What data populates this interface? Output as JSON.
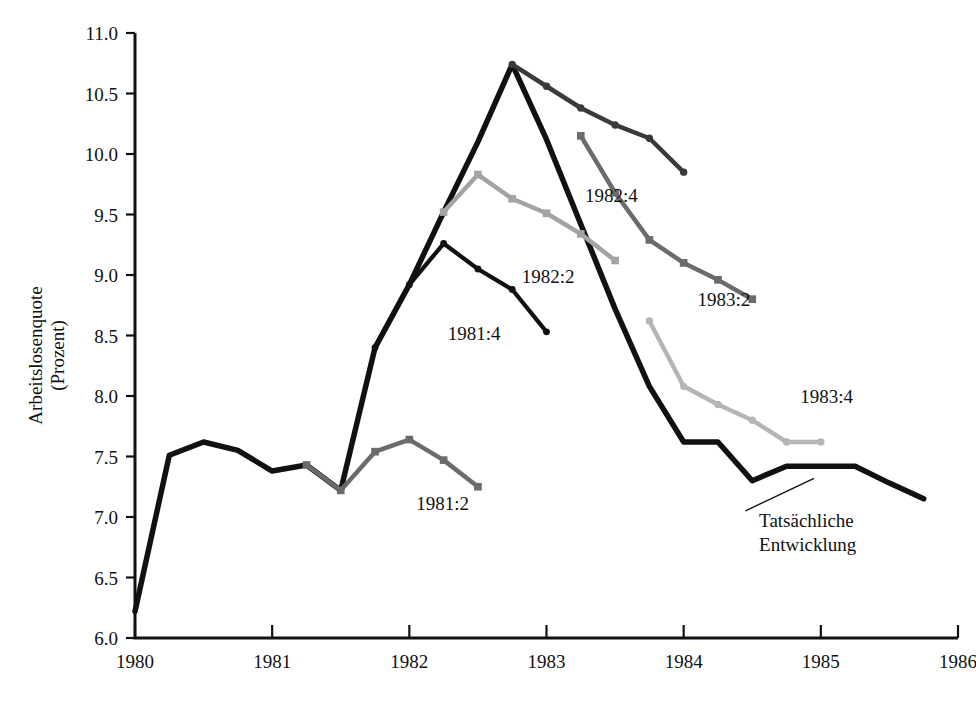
{
  "chart_data": {
    "type": "line",
    "title": "",
    "xlabel": "",
    "ylabel": "Arbeitslosenquote\n(Prozent)",
    "ylabel_line1": "Arbeitslosenquote",
    "ylabel_line2": "(Prozent)",
    "xlim": [
      1980,
      1986
    ],
    "ylim": [
      6.0,
      11.0
    ],
    "grid": false,
    "legend_position": "inline-annotations",
    "ytick_labels": [
      "11.0",
      "10.5",
      "10.0",
      "9.5",
      "9.0",
      "8.5",
      "8.0",
      "7.5",
      "7.0",
      "6.5",
      "6.0"
    ],
    "ytick_values": [
      11.0,
      10.5,
      10.0,
      9.5,
      9.0,
      8.5,
      8.0,
      7.5,
      7.0,
      6.5,
      6.0
    ],
    "xtick_labels": [
      "1980",
      "1981",
      "1982",
      "1983",
      "1984",
      "1985",
      "1986"
    ],
    "xtick_values": [
      1980,
      1981,
      1982,
      1983,
      1984,
      1985,
      1986
    ],
    "series": [
      {
        "name": "Tatsächliche Entwicklung",
        "label": "Tatsächliche\nEntwicklung",
        "label_line1": "Tatsächliche",
        "label_line2": "Entwicklung",
        "color": "#111111",
        "marker": "none",
        "width": 5.5,
        "label_x": 1984.55,
        "label_y": 6.92,
        "leader": [
          [
            1984.45,
            7.05
          ],
          [
            1984.95,
            7.32
          ]
        ],
        "x": [
          1980.0,
          1980.25,
          1980.5,
          1980.75,
          1981.0,
          1981.25,
          1981.5,
          1981.75,
          1982.0,
          1982.25,
          1982.5,
          1982.75,
          1983.0,
          1983.25,
          1983.5,
          1983.75,
          1984.0,
          1984.25,
          1984.5,
          1984.75,
          1985.0,
          1985.25,
          1985.5,
          1985.75
        ],
        "y": [
          6.22,
          7.51,
          7.62,
          7.55,
          7.38,
          7.43,
          7.22,
          8.4,
          8.92,
          9.52,
          10.1,
          10.74,
          10.12,
          9.42,
          8.72,
          8.08,
          7.62,
          7.62,
          7.3,
          7.42,
          7.42,
          7.42,
          7.28,
          7.15
        ]
      },
      {
        "name": "1981:2",
        "label": "1981:2",
        "color": "#6b6b6b",
        "marker": "square",
        "width": 4.5,
        "label_x": 1982.05,
        "label_y": 7.06,
        "x": [
          1981.25,
          1981.5,
          1981.75,
          1982.0,
          1982.25,
          1982.5
        ],
        "y": [
          7.43,
          7.22,
          7.54,
          7.64,
          7.47,
          7.25
        ]
      },
      {
        "name": "1981:4",
        "label": "1981:4",
        "color": "#111111",
        "marker": "circle",
        "width": 4.2,
        "label_x": 1982.28,
        "label_y": 8.46,
        "x": [
          1981.75,
          1982.0,
          1982.25,
          1982.5,
          1982.75,
          1983.0
        ],
        "y": [
          8.4,
          8.92,
          9.26,
          9.05,
          8.88,
          8.53
        ]
      },
      {
        "name": "1982:2",
        "label": "1982:2",
        "color": "#a3a3a3",
        "marker": "square",
        "width": 4.5,
        "label_x": 1982.82,
        "label_y": 8.93,
        "x": [
          1982.25,
          1982.5,
          1982.75,
          1983.0,
          1983.25,
          1983.5
        ],
        "y": [
          9.52,
          9.83,
          9.63,
          9.51,
          9.34,
          9.12
        ]
      },
      {
        "name": "1982:4",
        "label": "1982:4",
        "color": "#3a3a3a",
        "marker": "circle",
        "width": 4.5,
        "label_x": 1983.28,
        "label_y": 9.6,
        "x": [
          1982.75,
          1983.0,
          1983.25,
          1983.5,
          1983.75,
          1984.0
        ],
        "y": [
          10.74,
          10.56,
          10.38,
          10.24,
          10.13,
          9.85
        ]
      },
      {
        "name": "1983:2",
        "label": "1983:2",
        "color": "#6b6b6b",
        "marker": "square",
        "width": 4.5,
        "label_x": 1984.1,
        "label_y": 8.74,
        "x": [
          1983.25,
          1983.5,
          1983.75,
          1984.0,
          1984.25,
          1984.5
        ],
        "y": [
          10.15,
          9.68,
          9.29,
          9.1,
          8.96,
          8.8
        ]
      },
      {
        "name": "1983:4",
        "label": "1983:4",
        "color": "#b5b5b5",
        "marker": "circle",
        "width": 4.5,
        "label_x": 1984.85,
        "label_y": 7.94,
        "x": [
          1983.75,
          1984.0,
          1984.25,
          1984.5,
          1984.75,
          1985.0
        ],
        "y": [
          8.62,
          8.08,
          7.93,
          7.8,
          7.62,
          7.62
        ]
      }
    ]
  },
  "axes": {
    "y_axis_name": "y-axis",
    "x_axis_name": "x-axis"
  }
}
